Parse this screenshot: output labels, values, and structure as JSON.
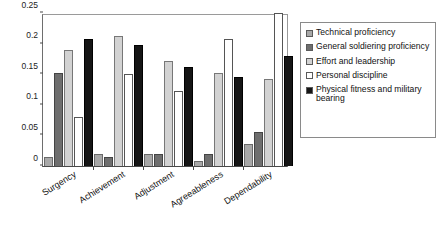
{
  "chart_data": {
    "type": "bar",
    "title": "",
    "xlabel": "",
    "ylabel": "",
    "ylim": [
      0,
      0.25
    ],
    "yticks": [
      0,
      0.05,
      0.1,
      0.15,
      0.2,
      0.25
    ],
    "ytick_labels": [
      "0",
      "0.05",
      "0.1",
      "0.15",
      "0.2",
      "0.25"
    ],
    "grid": false,
    "legend_position": "right",
    "categories": [
      "Surgency",
      "Achievement",
      "Adjustment",
      "Agreeableness",
      "Dependability"
    ],
    "series": [
      {
        "name": "Technical proficiency",
        "color": "#a8a8a8",
        "values": [
          0.015,
          0.019,
          0.019,
          0.009,
          0.036
        ]
      },
      {
        "name": "General soldiering proficiency",
        "color": "#6e6e6e",
        "values": [
          0.152,
          0.014,
          0.019,
          0.019,
          0.055
        ]
      },
      {
        "name": "Effort and leadership",
        "color": "#d2d2d2",
        "values": [
          0.19,
          0.213,
          0.171,
          0.152,
          0.142
        ]
      },
      {
        "name": "Personal discipline",
        "color": "#ffffff",
        "values": [
          0.08,
          0.151,
          0.122,
          0.207,
          0.25
        ]
      },
      {
        "name": "Physical fitness and military bearing",
        "color": "#151515",
        "values": [
          0.208,
          0.198,
          0.162,
          0.145,
          0.18
        ]
      }
    ]
  },
  "legend": {
    "items": [
      {
        "label": "Technical proficiency",
        "swatch": "#a8a8a8"
      },
      {
        "label": "General soldiering proficiency",
        "swatch": "#6e6e6e"
      },
      {
        "label": "Effort and leadership",
        "swatch": "#d2d2d2"
      },
      {
        "label": "Personal discipline",
        "swatch": "#ffffff"
      },
      {
        "label": "Physical fitness and military bearing",
        "swatch": "#151515"
      }
    ]
  }
}
